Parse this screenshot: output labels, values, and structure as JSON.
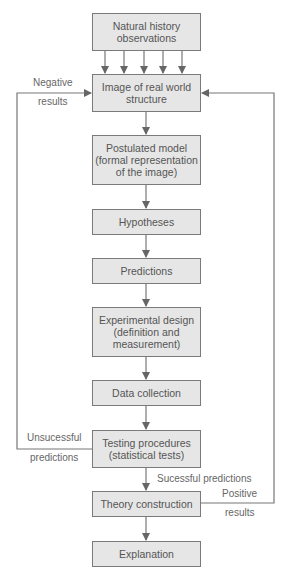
{
  "diagram": {
    "type": "flowchart",
    "colors": {
      "box_fill": "#e6e6e6",
      "box_border": "#7a7a7a",
      "text": "#555555",
      "arrow": "#666666"
    },
    "nodes": [
      {
        "id": "n1",
        "label": "Natural history observations"
      },
      {
        "id": "n2",
        "label": "Image of real world structure"
      },
      {
        "id": "n3",
        "label": "Postulated model (formal representation of the image)"
      },
      {
        "id": "n4",
        "label": "Hypotheses"
      },
      {
        "id": "n5",
        "label": "Predictions"
      },
      {
        "id": "n6",
        "label": "Experimental design (definition and measurement)"
      },
      {
        "id": "n7",
        "label": "Data collection"
      },
      {
        "id": "n8",
        "label": "Testing procedures (statistical tests)"
      },
      {
        "id": "n9",
        "label": "Theory construction"
      },
      {
        "id": "n10",
        "label": "Explanation"
      }
    ],
    "labels": {
      "negative": "Negative",
      "negative_results": "results",
      "unsuccessful": "Unsucessful",
      "unsuccessful_predictions": "predictions",
      "successful_predictions": "Sucessful predictions",
      "positive": "Positive",
      "positive_results": "results"
    },
    "edges": [
      {
        "from": "n1",
        "to": "n2",
        "count": 5
      },
      {
        "from": "n2",
        "to": "n3"
      },
      {
        "from": "n3",
        "to": "n4"
      },
      {
        "from": "n4",
        "to": "n5"
      },
      {
        "from": "n5",
        "to": "n6"
      },
      {
        "from": "n6",
        "to": "n7"
      },
      {
        "from": "n7",
        "to": "n8"
      },
      {
        "from": "n8",
        "to": "n9",
        "label": "Sucessful predictions"
      },
      {
        "from": "n9",
        "to": "n10"
      },
      {
        "from": "n8",
        "to": "n2",
        "label": "Unsucessful predictions / Negative results"
      },
      {
        "from": "n9",
        "to": "n2",
        "label": "Positive results"
      }
    ]
  }
}
